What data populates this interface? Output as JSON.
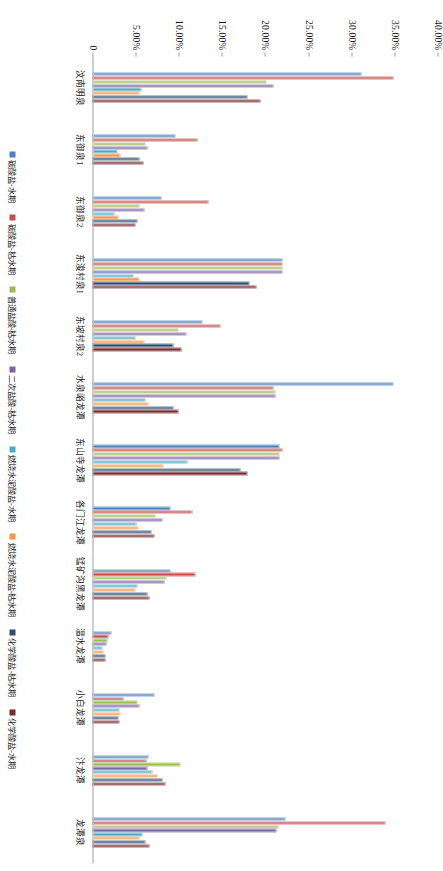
{
  "chart_data": {
    "type": "bar",
    "orientation": "vertical-rendered-rotated",
    "title": "",
    "xlabel": "",
    "ylabel": "",
    "ylim": [
      0,
      40
    ],
    "grid": false,
    "legend_position": "bottom",
    "tick_labels": [
      "0",
      "5.00%",
      "10.00%",
      "15.00%",
      "20.00%",
      "25.00%",
      "30.00%",
      "35.00%",
      "40.00%"
    ],
    "tick_values": [
      0,
      5,
      10,
      15,
      20,
      25,
      30,
      35,
      40
    ],
    "categories": [
      "汶南明泉",
      "东御泉1",
      "东御泉2",
      "东浚村泉1",
      "东坡村泉2",
      "水泉峪龙潭",
      "东山寺龙潭",
      "各门江龙潭",
      "锰矿沟黑龙潭",
      "温水龙潭",
      "小白龙潭",
      "汴龙潭",
      "龙潭泉"
    ],
    "series": [
      {
        "name": "碳酸盐-水期",
        "color": "#4f81bd",
        "values": [
          31.2,
          9.6,
          8.0,
          22.0,
          12.8,
          34.9,
          21.7,
          9.0,
          9.0,
          2.2,
          7.2,
          6.5,
          22.4
        ]
      },
      {
        "name": "碳酸盐-枯水期",
        "color": "#c0504d",
        "values": [
          34.9,
          12.2,
          13.4,
          22.0,
          14.8,
          21.0,
          22.0,
          11.6,
          12.0,
          1.9,
          3.6,
          6.3,
          34.0
        ]
      },
      {
        "name": "普通盐酸-枯水期",
        "color": "#9bbb59",
        "values": [
          20.2,
          6.1,
          5.4,
          22.0,
          10.0,
          21.2,
          21.7,
          7.3,
          8.6,
          1.7,
          5.2,
          10.2,
          21.6
        ]
      },
      {
        "name": "二次盐酸-枯水期",
        "color": "#8064a2",
        "values": [
          21.0,
          6.4,
          6.0,
          22.0,
          10.9,
          21.2,
          21.7,
          8.1,
          8.4,
          1.6,
          5.5,
          6.4,
          21.3
        ]
      },
      {
        "name": "燃烧水泥酸盐-水期",
        "color": "#4bacc6",
        "values": [
          5.7,
          2.9,
          2.6,
          4.8,
          5.0,
          6.1,
          11.0,
          5.1,
          5.2,
          1.2,
          3.1,
          7.0,
          5.8
        ]
      },
      {
        "name": "燃烧水泥酸盐-枯水期",
        "color": "#f79646",
        "values": [
          5.4,
          3.3,
          3.0,
          5.5,
          6.0,
          6.5,
          8.2,
          5.3,
          5.0,
          1.3,
          3.3,
          7.5,
          5.5
        ]
      },
      {
        "name": "化学酸盐-枯水期",
        "color": "#2c4d75",
        "values": [
          18.0,
          5.5,
          5.2,
          18.2,
          9.4,
          9.4,
          17.2,
          6.8,
          6.4,
          1.5,
          3.0,
          8.1,
          6.2
        ]
      },
      {
        "name": "化学酸盐-水期",
        "color": "#772c2a",
        "values": [
          19.5,
          5.9,
          5.0,
          19.0,
          10.3,
          10.0,
          18.0,
          7.2,
          6.6,
          1.5,
          3.1,
          8.5,
          6.6
        ]
      }
    ]
  }
}
